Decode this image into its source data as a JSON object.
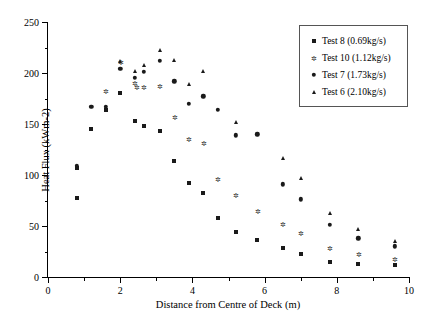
{
  "chart_data": {
    "type": "scatter",
    "title": "",
    "xlabel": "Distance from Centre of Deck (m)",
    "ylabel": "Heat Flux (kWm-2)",
    "xlim": [
      0,
      10
    ],
    "ylim": [
      0,
      250
    ],
    "x_major_ticks": [
      0,
      2,
      4,
      6,
      8,
      10
    ],
    "x_minor_ticks": [
      1,
      3,
      5,
      7,
      9
    ],
    "y_major_ticks": [
      0,
      50,
      100,
      150,
      200,
      250
    ],
    "y_minor_ticks": [
      25,
      75,
      125,
      175,
      225
    ],
    "grid": false,
    "legend_position": "top-right",
    "series": [
      {
        "name": "Test 8 (0.69kg/s)",
        "marker": "square",
        "color": "#1a1a1a",
        "points": [
          [
            0.8,
            107
          ],
          [
            0.8,
            77
          ],
          [
            1.2,
            145
          ],
          [
            1.6,
            164
          ],
          [
            2.0,
            180
          ],
          [
            2.4,
            153
          ],
          [
            2.65,
            148
          ],
          [
            3.1,
            143
          ],
          [
            3.5,
            114
          ],
          [
            3.9,
            92
          ],
          [
            4.3,
            82
          ],
          [
            4.7,
            58
          ],
          [
            5.2,
            44
          ],
          [
            5.8,
            36
          ],
          [
            6.5,
            28
          ],
          [
            7.0,
            23
          ],
          [
            7.8,
            15
          ],
          [
            8.6,
            13
          ],
          [
            9.6,
            12
          ]
        ]
      },
      {
        "name": "Test 10 (1.12kg/s)",
        "marker": "star",
        "color": "#2b2b2b",
        "points": [
          [
            1.6,
            182
          ],
          [
            2.0,
            211
          ],
          [
            2.4,
            190
          ],
          [
            2.45,
            186
          ],
          [
            2.65,
            186
          ],
          [
            3.1,
            187
          ],
          [
            3.5,
            157
          ],
          [
            3.9,
            135
          ],
          [
            4.3,
            131
          ],
          [
            4.7,
            96
          ],
          [
            5.2,
            80
          ],
          [
            5.8,
            65
          ],
          [
            6.5,
            52
          ],
          [
            7.0,
            43
          ],
          [
            7.8,
            28
          ],
          [
            8.6,
            23
          ],
          [
            9.6,
            18
          ]
        ]
      },
      {
        "name": "Test 7 (1.73kg/s)",
        "marker": "circle",
        "color": "#1a1a1a",
        "points": [
          [
            0.8,
            109
          ],
          [
            1.2,
            167
          ],
          [
            1.6,
            167
          ],
          [
            2.0,
            204
          ],
          [
            2.4,
            195
          ],
          [
            2.65,
            201
          ],
          [
            3.1,
            212
          ],
          [
            3.5,
            192
          ],
          [
            3.9,
            170
          ],
          [
            4.3,
            177
          ],
          [
            4.7,
            164
          ],
          [
            5.2,
            139
          ],
          [
            5.8,
            140
          ],
          [
            6.5,
            91
          ],
          [
            7.0,
            76
          ],
          [
            7.8,
            51
          ],
          [
            8.6,
            38
          ],
          [
            9.6,
            30
          ]
        ]
      },
      {
        "name": "Test 6 (2.10kg/s)",
        "marker": "triangle",
        "color": "#1a1a1a",
        "points": [
          [
            2.0,
            212
          ],
          [
            2.4,
            202
          ],
          [
            2.65,
            208
          ],
          [
            3.1,
            223
          ],
          [
            3.5,
            213
          ],
          [
            3.9,
            189
          ],
          [
            4.3,
            202
          ],
          [
            5.2,
            152
          ],
          [
            6.5,
            117
          ],
          [
            7.0,
            97
          ],
          [
            7.8,
            63
          ],
          [
            8.6,
            47
          ],
          [
            9.6,
            35
          ]
        ]
      }
    ]
  }
}
